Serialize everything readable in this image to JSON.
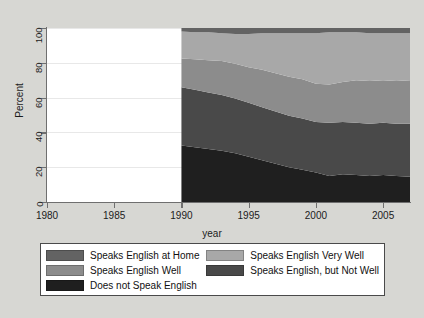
{
  "chart_data": {
    "type": "area",
    "title": "",
    "xlabel": "year",
    "ylabel": "Percent",
    "xlim": [
      1980,
      2007
    ],
    "ylim": [
      0,
      100
    ],
    "xticks": [
      1980,
      1985,
      1990,
      1995,
      2000,
      2005
    ],
    "yticks": [
      0,
      20,
      40,
      60,
      80,
      100
    ],
    "grid": true,
    "stacked": true,
    "legend_position": "bottom",
    "x": [
      1990,
      1991,
      1992,
      1993,
      1994,
      1995,
      1996,
      1997,
      1998,
      1999,
      2000,
      2001,
      2002,
      2003,
      2004,
      2005,
      2006,
      2007
    ],
    "series": [
      {
        "name": "Does not Speak English",
        "color": "#1f1f1f",
        "values": [
          32.5,
          31.5,
          30.5,
          29.5,
          28.0,
          26.0,
          24.0,
          22.0,
          20.0,
          18.5,
          17.0,
          15.0,
          16.0,
          15.5,
          15.0,
          15.5,
          15.0,
          14.5
        ]
      },
      {
        "name": "Speaks English, but Not Well",
        "color": "#494949",
        "values": [
          33.5,
          33.0,
          32.5,
          32.0,
          31.5,
          31.0,
          30.5,
          30.0,
          29.5,
          29.5,
          29.0,
          30.5,
          30.0,
          30.0,
          30.0,
          30.0,
          30.0,
          30.5
        ]
      },
      {
        "name": "Speaks English Very Well",
        "color": "#8c8c8c",
        "values": [
          16.5,
          17.5,
          18.5,
          19.5,
          20.0,
          20.5,
          21.5,
          22.0,
          22.5,
          22.5,
          22.0,
          22.0,
          23.0,
          24.5,
          24.5,
          24.5,
          24.5,
          25.0
        ]
      },
      {
        "name": "Speaks English Well",
        "color": "#a8a8a8",
        "values": [
          15.5,
          15.5,
          16.0,
          16.0,
          17.0,
          19.0,
          21.0,
          23.0,
          25.0,
          26.5,
          29.0,
          30.0,
          28.5,
          27.5,
          27.5,
          27.0,
          27.5,
          27.0
        ]
      },
      {
        "name": "Speaks English at Home",
        "color": "#636363",
        "values": [
          2.0,
          2.5,
          2.5,
          3.0,
          3.5,
          3.5,
          3.0,
          3.0,
          3.0,
          3.0,
          3.0,
          2.5,
          2.5,
          2.5,
          3.0,
          3.0,
          3.0,
          3.0
        ]
      }
    ],
    "legend_entries": [
      {
        "label": "Speaks English at Home",
        "color": "#636363"
      },
      {
        "label": "Speaks English Very Well",
        "color": "#a8a8a8"
      },
      {
        "label": "Speaks English Well",
        "color": "#8c8c8c"
      },
      {
        "label": "Speaks English, but Not Well",
        "color": "#494949"
      },
      {
        "label": "Does not Speak English",
        "color": "#1f1f1f"
      }
    ]
  },
  "figure": {
    "background_color": "#d7d7d3",
    "plot_background_color": "#ffffff",
    "axis_color": "#6f6f6f",
    "gridline_color": "#e8e8e8"
  }
}
